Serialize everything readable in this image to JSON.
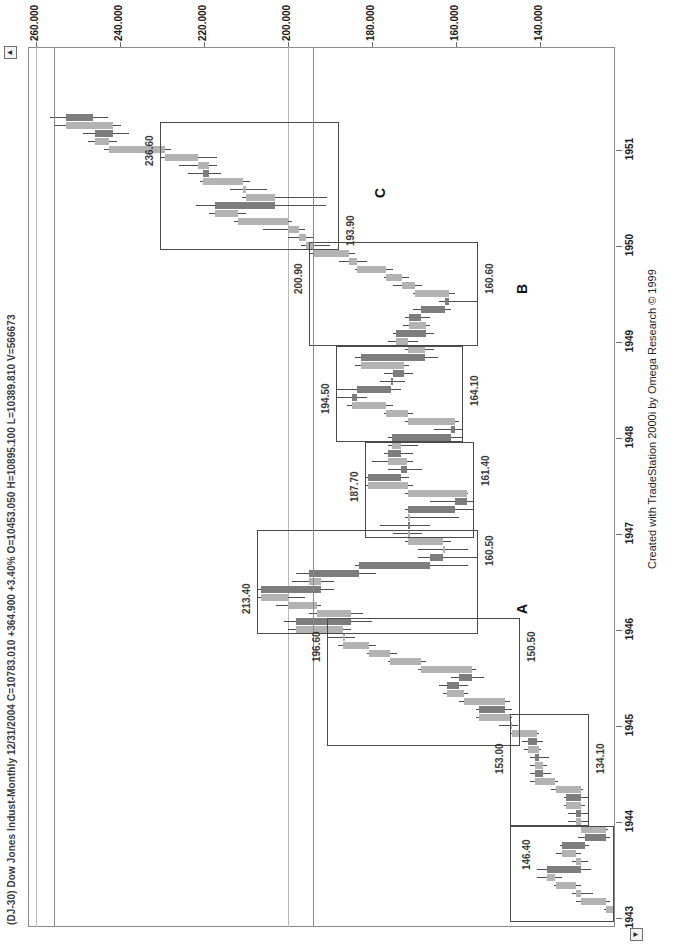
{
  "window": {
    "symbol_line": "(DJ-30) Dow Jones Indust-Monthly  12/31/2004  C=10783.010  +364.900  +3.40%  O=10453.050  H=10895.100  L=10389.810  V=566673",
    "credit": "Created with TradeStation 2000i by Omega Research © 1999"
  },
  "scroll": {
    "up_arrow": "▲",
    "down_arrow": "▼"
  },
  "chart_data": {
    "type": "candlestick",
    "title": "(DJ-30) Dow Jones Indust-Monthly",
    "subtitle": "12/31/2004  C=10783.010  +364.900  +3.40%  O=10453.050  H=10895.100  L=10389.810  V=566673",
    "xlabel": "",
    "ylabel": "",
    "grid": true,
    "legend": "none",
    "ylim": [
      128,
      268
    ],
    "yticks": [
      "260.000",
      "240.000",
      "220.000",
      "200.000",
      "180.000",
      "160.000",
      "140.000"
    ],
    "ytick_values": [
      260,
      240,
      220,
      200,
      180,
      160,
      140
    ],
    "xticks": [
      "1943",
      "1944",
      "1945",
      "1946",
      "1947",
      "1948",
      "1949",
      "1950",
      "1951"
    ],
    "quote": {
      "date": "12/31/2004",
      "close": "10783.010",
      "change": "+364.900",
      "change_pct": "+3.40%",
      "open": "10453.050",
      "high": "10895.100",
      "low": "10389.810",
      "volume": "566673"
    },
    "annotations": [
      {
        "label": "A",
        "kind": "box-letter"
      },
      {
        "label": "B",
        "kind": "box-letter"
      },
      {
        "label": "C",
        "kind": "box-letter"
      },
      {
        "label": "146.40",
        "kind": "price-level",
        "value": 146.4
      },
      {
        "label": "134.10",
        "kind": "price-level",
        "value": 134.1
      },
      {
        "label": "153.00",
        "kind": "price-level",
        "value": 153.0
      },
      {
        "label": "150.50",
        "kind": "price-level",
        "value": 150.5
      },
      {
        "label": "196.60",
        "kind": "price-level",
        "value": 196.6
      },
      {
        "label": "213.40",
        "kind": "price-level",
        "value": 213.4
      },
      {
        "label": "160.50",
        "kind": "price-level",
        "value": 160.5
      },
      {
        "label": "187.70",
        "kind": "price-level",
        "value": 187.7
      },
      {
        "label": "161.40",
        "kind": "price-level",
        "value": 161.4
      },
      {
        "label": "194.50",
        "kind": "price-level",
        "value": 194.5
      },
      {
        "label": "164.10",
        "kind": "price-level",
        "value": 164.1
      },
      {
        "label": "200.90",
        "kind": "price-level",
        "value": 200.9
      },
      {
        "label": "160.60",
        "kind": "price-level",
        "value": 160.6
      },
      {
        "label": "193.90",
        "kind": "price-level",
        "value": 193.9
      },
      {
        "label": "236.60",
        "kind": "price-level",
        "value": 236.6
      }
    ],
    "series": [
      {
        "name": "DJIA Monthly OHLC",
        "bars": [
          {
            "t": "1943-01",
            "o": 119.4,
            "h": 126.0,
            "l": 118.5,
            "c": 125.6
          },
          {
            "t": "1943-02",
            "o": 125.6,
            "h": 130.4,
            "l": 124.0,
            "c": 130.0
          },
          {
            "t": "1943-03",
            "o": 130.0,
            "h": 137.0,
            "l": 129.0,
            "c": 136.0
          },
          {
            "t": "1943-04",
            "o": 136.0,
            "h": 138.0,
            "l": 133.0,
            "c": 137.0
          },
          {
            "t": "1943-05",
            "o": 137.0,
            "h": 142.4,
            "l": 136.0,
            "c": 142.0
          },
          {
            "t": "1943-06",
            "o": 142.0,
            "h": 146.4,
            "l": 140.5,
            "c": 144.0
          },
          {
            "t": "1943-07",
            "o": 144.0,
            "h": 146.4,
            "l": 133.5,
            "c": 136.0
          },
          {
            "t": "1943-08",
            "o": 136.0,
            "h": 138.0,
            "l": 134.1,
            "c": 137.0
          },
          {
            "t": "1943-09",
            "o": 137.0,
            "h": 142.0,
            "l": 136.0,
            "c": 140.5
          },
          {
            "t": "1943-10",
            "o": 140.5,
            "h": 141.0,
            "l": 134.1,
            "c": 135.0
          },
          {
            "t": "1943-11",
            "o": 135.0,
            "h": 136.5,
            "l": 128.9,
            "c": 130.0
          },
          {
            "t": "1943-12",
            "o": 130.0,
            "h": 136.0,
            "l": 129.5,
            "c": 135.9
          },
          {
            "t": "1944-01",
            "o": 135.9,
            "h": 139.0,
            "l": 134.2,
            "c": 137.0
          },
          {
            "t": "1944-02",
            "o": 137.0,
            "h": 139.0,
            "l": 134.1,
            "c": 136.0
          },
          {
            "t": "1944-03",
            "o": 136.0,
            "h": 140.0,
            "l": 135.0,
            "c": 139.5
          },
          {
            "t": "1944-04",
            "o": 139.5,
            "h": 140.0,
            "l": 134.1,
            "c": 136.0
          },
          {
            "t": "1944-05",
            "o": 136.0,
            "h": 143.0,
            "l": 135.5,
            "c": 142.0
          },
          {
            "t": "1944-06",
            "o": 142.0,
            "h": 148.0,
            "l": 141.5,
            "c": 147.0
          },
          {
            "t": "1944-07",
            "o": 147.0,
            "h": 148.0,
            "l": 143.0,
            "c": 145.0
          },
          {
            "t": "1944-08",
            "o": 145.0,
            "h": 148.0,
            "l": 144.0,
            "c": 147.0
          },
          {
            "t": "1944-09",
            "o": 147.0,
            "h": 148.0,
            "l": 143.5,
            "c": 146.0
          },
          {
            "t": "1944-10",
            "o": 146.0,
            "h": 149.5,
            "l": 145.5,
            "c": 148.5
          },
          {
            "t": "1944-11",
            "o": 148.5,
            "h": 150.0,
            "l": 145.0,
            "c": 146.5
          },
          {
            "t": "1944-12",
            "o": 146.5,
            "h": 153.0,
            "l": 146.0,
            "c": 152.3
          },
          {
            "t": "1945-01",
            "o": 152.3,
            "h": 155.5,
            "l": 151.0,
            "c": 153.0
          },
          {
            "t": "1945-02",
            "o": 153.0,
            "h": 161.0,
            "l": 152.5,
            "c": 160.4
          },
          {
            "t": "1945-03",
            "o": 160.4,
            "h": 161.0,
            "l": 152.5,
            "c": 154.0
          },
          {
            "t": "1945-04",
            "o": 154.0,
            "h": 165.0,
            "l": 153.0,
            "c": 164.0
          },
          {
            "t": "1945-05",
            "o": 164.0,
            "h": 169.0,
            "l": 163.0,
            "c": 168.0
          },
          {
            "t": "1945-06",
            "o": 168.0,
            "h": 170.0,
            "l": 163.0,
            "c": 165.0
          },
          {
            "t": "1945-07",
            "o": 165.0,
            "h": 167.0,
            "l": 159.0,
            "c": 162.0
          },
          {
            "t": "1945-08",
            "o": 162.0,
            "h": 175.0,
            "l": 161.0,
            "c": 174.3
          },
          {
            "t": "1945-09",
            "o": 174.3,
            "h": 182.0,
            "l": 173.0,
            "c": 181.7
          },
          {
            "t": "1945-10",
            "o": 181.7,
            "h": 187.0,
            "l": 180.0,
            "c": 186.6
          },
          {
            "t": "1945-11",
            "o": 186.6,
            "h": 194.0,
            "l": 185.0,
            "c": 192.9
          },
          {
            "t": "1945-12",
            "o": 192.9,
            "h": 196.6,
            "l": 190.0,
            "c": 192.9
          },
          {
            "t": "1946-01",
            "o": 192.9,
            "h": 206.0,
            "l": 191.0,
            "c": 204.0
          },
          {
            "t": "1946-02",
            "o": 204.0,
            "h": 207.0,
            "l": 186.0,
            "c": 191.0
          },
          {
            "t": "1946-03",
            "o": 191.0,
            "h": 201.0,
            "l": 188.0,
            "c": 199.0
          },
          {
            "t": "1946-04",
            "o": 199.0,
            "h": 209.0,
            "l": 198.0,
            "c": 206.0
          },
          {
            "t": "1946-05",
            "o": 206.0,
            "h": 213.4,
            "l": 202.0,
            "c": 212.5
          },
          {
            "t": "1946-06",
            "o": 212.5,
            "h": 213.4,
            "l": 195.0,
            "c": 198.0
          },
          {
            "t": "1946-07",
            "o": 198.0,
            "h": 205.0,
            "l": 195.0,
            "c": 201.0
          },
          {
            "t": "1946-08",
            "o": 201.0,
            "h": 204.0,
            "l": 185.0,
            "c": 189.0
          },
          {
            "t": "1946-09",
            "o": 189.0,
            "h": 190.0,
            "l": 163.0,
            "c": 172.0
          },
          {
            "t": "1946-10",
            "o": 172.0,
            "h": 175.0,
            "l": 160.5,
            "c": 169.0
          },
          {
            "t": "1946-11",
            "o": 169.0,
            "h": 175.0,
            "l": 163.0,
            "c": 169.0
          },
          {
            "t": "1946-12",
            "o": 169.0,
            "h": 178.0,
            "l": 167.0,
            "c": 177.2
          },
          {
            "t": "1947-01",
            "o": 177.2,
            "h": 181.0,
            "l": 174.0,
            "c": 177.2
          },
          {
            "t": "1947-02",
            "o": 177.2,
            "h": 184.0,
            "l": 172.0,
            "c": 177.0
          },
          {
            "t": "1947-03",
            "o": 177.0,
            "h": 178.0,
            "l": 165.0,
            "c": 177.2
          },
          {
            "t": "1947-04",
            "o": 177.2,
            "h": 178.0,
            "l": 161.4,
            "c": 166.0
          },
          {
            "t": "1947-05",
            "o": 166.0,
            "h": 172.0,
            "l": 161.4,
            "c": 163.2
          },
          {
            "t": "1947-06",
            "o": 163.2,
            "h": 178.0,
            "l": 163.0,
            "c": 177.2
          },
          {
            "t": "1947-07",
            "o": 177.2,
            "h": 187.7,
            "l": 176.0,
            "c": 186.9
          },
          {
            "t": "1947-08",
            "o": 186.9,
            "h": 187.7,
            "l": 177.0,
            "c": 179.0
          },
          {
            "t": "1947-09",
            "o": 179.0,
            "h": 182.0,
            "l": 174.0,
            "c": 177.5
          },
          {
            "t": "1947-10",
            "o": 177.5,
            "h": 186.0,
            "l": 176.0,
            "c": 182.0
          },
          {
            "t": "1947-11",
            "o": 182.0,
            "h": 183.0,
            "l": 176.0,
            "c": 179.0
          },
          {
            "t": "1947-12",
            "o": 179.0,
            "h": 182.0,
            "l": 175.0,
            "c": 181.2
          },
          {
            "t": "1948-01",
            "o": 181.2,
            "h": 182.0,
            "l": 164.1,
            "c": 167.0
          },
          {
            "t": "1948-02",
            "o": 167.0,
            "h": 171.0,
            "l": 164.1,
            "c": 166.0
          },
          {
            "t": "1948-03",
            "o": 166.0,
            "h": 178.0,
            "l": 165.0,
            "c": 177.2
          },
          {
            "t": "1948-04",
            "o": 177.2,
            "h": 183.0,
            "l": 176.0,
            "c": 182.5
          },
          {
            "t": "1948-05",
            "o": 182.5,
            "h": 192.0,
            "l": 181.0,
            "c": 190.7
          },
          {
            "t": "1948-06",
            "o": 190.7,
            "h": 194.5,
            "l": 187.0,
            "c": 189.5
          },
          {
            "t": "1948-07",
            "o": 189.5,
            "h": 194.5,
            "l": 179.0,
            "c": 181.3
          },
          {
            "t": "1948-08",
            "o": 181.3,
            "h": 184.0,
            "l": 178.0,
            "c": 181.0
          },
          {
            "t": "1948-09",
            "o": 181.0,
            "h": 183.0,
            "l": 176.0,
            "c": 178.3
          },
          {
            "t": "1948-10",
            "o": 178.3,
            "h": 190.0,
            "l": 177.0,
            "c": 188.5
          },
          {
            "t": "1948-11",
            "o": 188.5,
            "h": 190.0,
            "l": 170.0,
            "c": 173.2
          },
          {
            "t": "1948-12",
            "o": 173.2,
            "h": 178.0,
            "l": 171.0,
            "c": 177.3
          },
          {
            "t": "1949-01",
            "o": 177.3,
            "h": 182.0,
            "l": 175.0,
            "c": 180.2
          },
          {
            "t": "1949-02",
            "o": 180.2,
            "h": 181.0,
            "l": 171.0,
            "c": 173.1
          },
          {
            "t": "1949-03",
            "o": 173.1,
            "h": 178.5,
            "l": 172.0,
            "c": 177.1
          },
          {
            "t": "1949-04",
            "o": 177.1,
            "h": 178.0,
            "l": 172.0,
            "c": 174.2
          },
          {
            "t": "1949-05",
            "o": 174.2,
            "h": 176.0,
            "l": 167.0,
            "c": 168.4
          },
          {
            "t": "1949-06",
            "o": 168.4,
            "h": 170.0,
            "l": 160.6,
            "c": 167.4
          },
          {
            "t": "1949-07",
            "o": 167.4,
            "h": 176.0,
            "l": 166.0,
            "c": 175.6
          },
          {
            "t": "1949-08",
            "o": 175.6,
            "h": 181.0,
            "l": 174.0,
            "c": 178.7
          },
          {
            "t": "1949-09",
            "o": 178.7,
            "h": 183.0,
            "l": 177.0,
            "c": 182.5
          },
          {
            "t": "1949-10",
            "o": 182.5,
            "h": 190.0,
            "l": 181.0,
            "c": 189.5
          },
          {
            "t": "1949-11",
            "o": 189.5,
            "h": 193.9,
            "l": 187.0,
            "c": 191.4
          },
          {
            "t": "1949-12",
            "o": 191.4,
            "h": 200.9,
            "l": 190.0,
            "c": 200.1
          },
          {
            "t": "1950-01",
            "o": 200.1,
            "h": 203.0,
            "l": 196.0,
            "c": 201.8
          },
          {
            "t": "1950-02",
            "o": 201.8,
            "h": 206.0,
            "l": 200.0,
            "c": 203.4
          },
          {
            "t": "1950-03",
            "o": 203.4,
            "h": 212.0,
            "l": 202.0,
            "c": 206.0
          },
          {
            "t": "1950-04",
            "o": 206.0,
            "h": 219.0,
            "l": 205.0,
            "c": 218.0
          },
          {
            "t": "1950-05",
            "o": 218.0,
            "h": 225.0,
            "l": 216.0,
            "c": 223.4
          },
          {
            "t": "1950-06",
            "o": 223.4,
            "h": 228.0,
            "l": 197.0,
            "c": 209.1
          },
          {
            "t": "1950-07",
            "o": 209.1,
            "h": 217.0,
            "l": 196.8,
            "c": 216.0
          },
          {
            "t": "1950-08",
            "o": 216.0,
            "h": 220.0,
            "l": 211.0,
            "c": 216.9
          },
          {
            "t": "1950-09",
            "o": 216.9,
            "h": 227.0,
            "l": 215.0,
            "c": 226.4
          },
          {
            "t": "1950-10",
            "o": 226.4,
            "h": 230.0,
            "l": 222.0,
            "c": 225.0
          },
          {
            "t": "1950-11",
            "o": 225.0,
            "h": 232.0,
            "l": 223.0,
            "c": 227.6
          },
          {
            "t": "1950-12",
            "o": 227.6,
            "h": 236.6,
            "l": 223.0,
            "c": 235.4
          },
          {
            "t": "1951-01",
            "o": 235.4,
            "h": 250.0,
            "l": 234.0,
            "c": 248.8
          },
          {
            "t": "1951-02",
            "o": 248.8,
            "h": 254.0,
            "l": 247.0,
            "c": 252.1
          },
          {
            "t": "1951-03",
            "o": 252.1,
            "h": 255.0,
            "l": 244.0,
            "c": 247.9
          },
          {
            "t": "1951-04",
            "o": 247.9,
            "h": 262.0,
            "l": 246.0,
            "c": 259.1
          },
          {
            "t": "1951-05",
            "o": 259.1,
            "h": 263.0,
            "l": 249.0,
            "c": 252.6
          }
        ]
      }
    ]
  }
}
